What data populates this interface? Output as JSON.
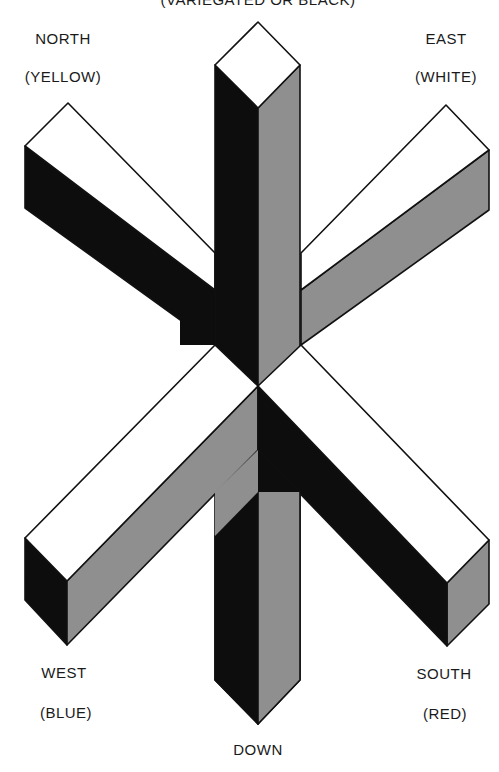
{
  "diagram": {
    "top_label": "(VARIEGATED OR BLACK)",
    "directions": {
      "north": {
        "name": "NORTH",
        "color": "(YELLOW)"
      },
      "east": {
        "name": "EAST",
        "color": "(WHITE)"
      },
      "west": {
        "name": "WEST",
        "color": "(BLUE)"
      },
      "south": {
        "name": "SOUTH",
        "color": "(RED)"
      },
      "down": {
        "name": "DOWN"
      }
    },
    "fill_colors": {
      "top": "#ffffff",
      "dark": "#0d0d0d",
      "gray": "#8f8f8f"
    }
  }
}
